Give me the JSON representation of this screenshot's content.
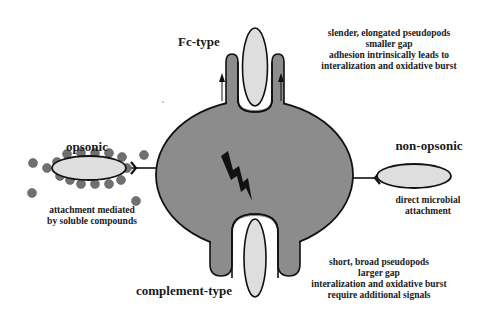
{
  "colors": {
    "cell": "#8c8c8c",
    "microbe": "#dedede",
    "opsonin": "#707070",
    "outline": "#111111",
    "background": "#ffffff"
  },
  "labels": {
    "fc_type": {
      "title": "Fc-type",
      "lines": [
        "slender, elongated pseudopods",
        "smaller gap",
        "adhesion intrinsically leads to",
        "interalization and oxidative burst"
      ]
    },
    "complement_type": {
      "title": "complement-type",
      "lines": [
        "short, broad pseudopods",
        "larger gap",
        "interalization and oxidative burst",
        "require additional signals"
      ]
    },
    "opsonic": {
      "title": "opsonic",
      "lines": [
        "attachment mediated",
        "by soluble compounds"
      ]
    },
    "non_opsonic": {
      "title": "non-opsonic",
      "lines": [
        "direct microbial",
        "attachment"
      ]
    }
  },
  "icons": {
    "signal": "lightning-bolt-icon",
    "movement": "up-arrow-icon"
  }
}
